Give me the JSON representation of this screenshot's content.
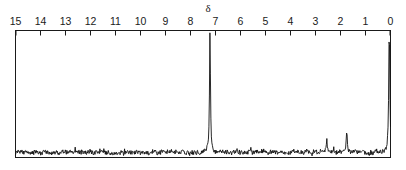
{
  "figure": {
    "kind": "nmr-spectrum",
    "axis_symbol": "δ",
    "axis_symbol_name": "delta-ppm-symbol",
    "stroke_color": "#111111",
    "frame_color": "#1a1a1a",
    "background_color": "#ffffff"
  },
  "axis": {
    "name": "chemical-shift-axis",
    "direction": "right-to-left",
    "min": 0,
    "max": 15,
    "tick_labels": [
      "15",
      "14",
      "13",
      "12",
      "11",
      "10",
      "9",
      "8",
      "7",
      "6",
      "5",
      "4",
      "3",
      "2",
      "1",
      "0"
    ],
    "tick_values": [
      15,
      14,
      13,
      12,
      11,
      10,
      9,
      8,
      7,
      6,
      5,
      4,
      3,
      2,
      1,
      0
    ]
  },
  "chart_data": {
    "type": "line",
    "title": "",
    "subtitle": "",
    "xlabel": "δ",
    "ylabel": "",
    "xlim": [
      15,
      0
    ],
    "ylim": [
      0,
      1
    ],
    "grid": false,
    "legend": null,
    "annotations": [
      {
        "label": "δ",
        "x": 7.3,
        "y": 1.0,
        "placement": "above-axis"
      }
    ],
    "series": [
      {
        "name": "nmr-trace",
        "color": "#111111",
        "baseline": 0.04,
        "noise_amplitude": 0.035,
        "peaks": [
          {
            "label": "",
            "shift_ppm": 7.22,
            "height": 0.97,
            "width_ppm": 0.045
          },
          {
            "label": "",
            "shift_ppm": 0.05,
            "height": 0.99,
            "width_ppm": 0.05
          },
          {
            "label": "",
            "shift_ppm": 1.75,
            "height": 0.16,
            "width_ppm": 0.06
          },
          {
            "label": "",
            "shift_ppm": 2.55,
            "height": 0.09,
            "width_ppm": 0.05
          }
        ]
      }
    ]
  }
}
